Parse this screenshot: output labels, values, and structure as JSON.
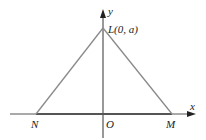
{
  "diagram": {
    "type": "coordinate-triangle",
    "axes": {
      "x_label": "x",
      "y_label": "y",
      "origin_label": "O"
    },
    "points": {
      "L": {
        "label": "L(0, a)",
        "name": "L",
        "coords": "(0, a)"
      },
      "N": {
        "label": "N"
      },
      "M": {
        "label": "M"
      }
    },
    "segments": [
      "LN",
      "LM",
      "NM"
    ],
    "colors": {
      "triangle": "#8a8a8a",
      "axis": "#333333",
      "base": "#555555"
    }
  }
}
